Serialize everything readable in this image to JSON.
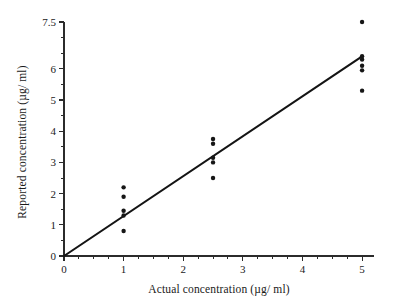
{
  "chart_data": {
    "type": "scatter",
    "title": "",
    "xlabel": "Actual concentration (µg/ ml)",
    "ylabel": "Reported concentration (µg/ ml)",
    "xlim": [
      0,
      5.2
    ],
    "ylim": [
      0,
      7.5
    ],
    "grid": false,
    "legend": null,
    "x_major_ticks": [
      0,
      1,
      2,
      3,
      4,
      5
    ],
    "x_major_tick_labels": [
      "0",
      "1",
      "2",
      "3",
      "4",
      "5"
    ],
    "x_minor_tick_step": 0.25,
    "y_major_ticks": [
      0,
      1,
      2,
      3,
      4,
      5,
      6,
      7.5
    ],
    "y_major_tick_labels": [
      "0",
      "1",
      "2",
      "3",
      "4",
      "5",
      "6",
      "7.5"
    ],
    "y_minor_tick_step": 0.5,
    "series": [
      {
        "name": "measurements",
        "marker": "circle",
        "color": "#161616",
        "points": [
          {
            "x": 1.0,
            "y": 2.2
          },
          {
            "x": 1.0,
            "y": 1.9
          },
          {
            "x": 1.0,
            "y": 1.45
          },
          {
            "x": 1.0,
            "y": 1.3
          },
          {
            "x": 1.0,
            "y": 0.8
          },
          {
            "x": 2.5,
            "y": 3.75
          },
          {
            "x": 2.5,
            "y": 3.6
          },
          {
            "x": 2.5,
            "y": 3.15
          },
          {
            "x": 2.5,
            "y": 3.0
          },
          {
            "x": 2.5,
            "y": 2.5
          },
          {
            "x": 5.0,
            "y": 7.5
          },
          {
            "x": 5.0,
            "y": 6.4
          },
          {
            "x": 5.0,
            "y": 6.3
          },
          {
            "x": 5.0,
            "y": 6.1
          },
          {
            "x": 5.0,
            "y": 5.95
          },
          {
            "x": 5.0,
            "y": 5.3
          }
        ]
      }
    ],
    "fit_line": {
      "name": "regression-line",
      "color": "#141414",
      "x_start": 0.0,
      "y_start": 0.0,
      "x_end": 5.0,
      "y_end": 6.4,
      "slope": 1.28,
      "intercept": 0.0
    }
  }
}
